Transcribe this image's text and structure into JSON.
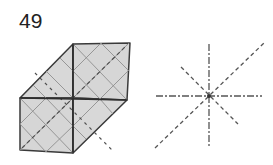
{
  "diagram": {
    "step_number": "49",
    "figure": "origami-folded-model",
    "legend": "crease-pattern-lines",
    "colors": {
      "paper_fill": "#d6d6d6",
      "outline": "#3a3a3a",
      "crease": "#8a8a8a",
      "dash": "#555555"
    }
  }
}
